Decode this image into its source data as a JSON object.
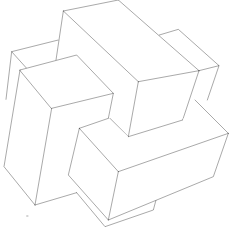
{
  "diagram": {
    "title": "",
    "colors": {
      "background": "#ffffff",
      "stroke": "#111111"
    },
    "pieces": [
      {
        "id": "top-bar",
        "label": ""
      },
      {
        "id": "right-stub",
        "label": ""
      },
      {
        "id": "left-stub",
        "label": ""
      },
      {
        "id": "left-tall-bar",
        "label": ""
      },
      {
        "id": "front-l-bar",
        "label": ""
      },
      {
        "id": "bottom-stub",
        "label": ""
      }
    ]
  }
}
